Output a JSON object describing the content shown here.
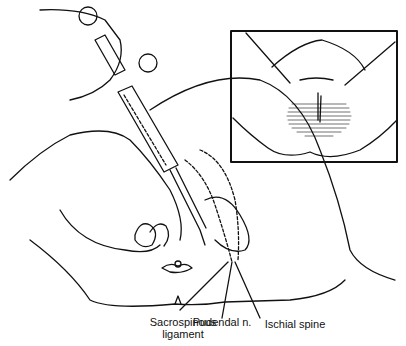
{
  "figure": {
    "labels": [
      {
        "id": "sacrospinous",
        "line1": "Sacrospinous",
        "line2": "ligament"
      },
      {
        "id": "pudendal",
        "line1": "Pudendal n.",
        "line2": ""
      },
      {
        "id": "ischial",
        "line1": "Ischial spine",
        "line2": ""
      }
    ],
    "inset": {
      "description": "Perineal view showing shaded area of anesthesia"
    },
    "colors": {
      "line": "#111111",
      "background": "#ffffff"
    }
  }
}
